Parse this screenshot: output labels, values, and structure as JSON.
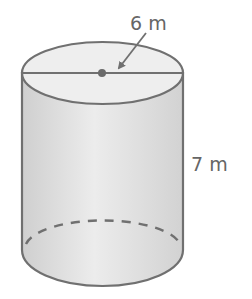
{
  "figure": {
    "type": "cylinder",
    "radius_label": "6 m",
    "height_label": "7 m",
    "colors": {
      "stroke": "#707070",
      "body_fill": "#dcdcdc",
      "top_fill": "#eeeeee",
      "dot": "#6a6a6a",
      "text": "#666666"
    }
  }
}
